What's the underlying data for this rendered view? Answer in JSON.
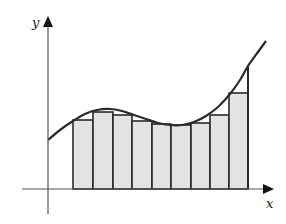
{
  "diagram": {
    "title": "",
    "axes": {
      "x_label": "x",
      "y_label": "y",
      "origin_px": [
        48,
        189
      ],
      "x_end_px": 274,
      "y_end_px": 16
    },
    "colors": {
      "stroke": "#2a2a2a",
      "axis": "#555555",
      "rect_fill": "#e3e3e3",
      "background": "#ffffff"
    },
    "curve_points_px": [
      [
        48,
        140
      ],
      [
        60,
        130
      ],
      [
        73,
        121
      ],
      [
        85,
        114
      ],
      [
        97,
        110
      ],
      [
        110,
        109
      ],
      [
        122,
        111
      ],
      [
        134,
        115
      ],
      [
        146,
        119
      ],
      [
        158,
        123
      ],
      [
        170,
        125
      ],
      [
        182,
        125
      ],
      [
        194,
        122
      ],
      [
        206,
        116
      ],
      [
        218,
        107
      ],
      [
        230,
        94
      ],
      [
        240,
        80
      ],
      [
        248,
        66
      ],
      [
        258,
        52
      ],
      [
        266,
        41
      ]
    ],
    "rectangles": [
      {
        "x": 73,
        "width": 20,
        "top": 120
      },
      {
        "x": 93,
        "width": 20,
        "top": 112
      },
      {
        "x": 113,
        "width": 19,
        "top": 115
      },
      {
        "x": 132,
        "width": 20,
        "top": 121
      },
      {
        "x": 152,
        "width": 19,
        "top": 124
      },
      {
        "x": 171,
        "width": 20,
        "top": 125
      },
      {
        "x": 191,
        "width": 19,
        "top": 123
      },
      {
        "x": 210,
        "width": 19,
        "top": 115
      },
      {
        "x": 229,
        "width": 19,
        "top": 93
      }
    ],
    "baseline_px": 189,
    "right_bound_line": {
      "x": 248,
      "top": 66
    }
  }
}
